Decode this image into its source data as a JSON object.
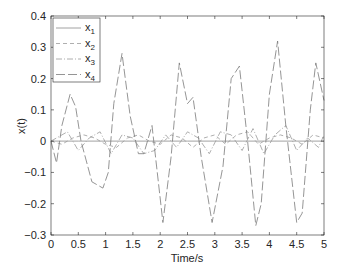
{
  "chart_data": {
    "type": "line",
    "title": "",
    "xlabel": "Time/s",
    "ylabel": "x(t)",
    "xlim": [
      0,
      5
    ],
    "ylim": [
      -0.3,
      0.4
    ],
    "grid": false,
    "legend_position": "upper-left",
    "xticks": [
      "0",
      "0.5",
      "1",
      "1.5",
      "2",
      "2.5",
      "3",
      "3.5",
      "4",
      "4.5",
      "5"
    ],
    "yticks": [
      "-0.3",
      "-0.2",
      "-0.1",
      "0",
      "0.1",
      "0.2",
      "0.3",
      "0.4"
    ],
    "series": [
      {
        "name": "x1",
        "style": "solid",
        "color": "#8a8a8a",
        "x": [
          0,
          0.5,
          1,
          1.5,
          2,
          2.5,
          3,
          3.5,
          4,
          4.5,
          5
        ],
        "values": [
          0,
          0,
          0,
          0,
          0,
          0,
          0,
          0,
          0,
          0,
          0
        ]
      },
      {
        "name": "x2",
        "style": "dashed",
        "color": "#9a9a9a",
        "x": [
          0,
          0.2,
          0.4,
          0.6,
          0.8,
          1.0,
          1.2,
          1.4,
          1.6,
          1.8,
          2.0,
          2.2,
          2.4,
          2.6,
          2.8,
          3.0,
          3.2,
          3.4,
          3.6,
          3.8,
          4.0,
          4.2,
          4.4,
          4.6,
          4.8,
          5.0
        ],
        "values": [
          0,
          -0.01,
          0.01,
          0.02,
          0.01,
          -0.01,
          -0.02,
          0.01,
          0.02,
          0.0,
          -0.01,
          0.02,
          0.01,
          -0.02,
          0.01,
          0.02,
          -0.01,
          0.02,
          0.03,
          -0.01,
          0.01,
          0.02,
          0.01,
          -0.01,
          0.02,
          0.01
        ]
      },
      {
        "name": "x3",
        "style": "dash-dot",
        "color": "#9a9a9a",
        "x": [
          0,
          0.3,
          0.5,
          0.7,
          0.9,
          1.1,
          1.3,
          1.5,
          1.7,
          1.9,
          2.1,
          2.3,
          2.5,
          2.7,
          2.9,
          3.1,
          3.3,
          3.5,
          3.7,
          3.9,
          4.1,
          4.3,
          4.5,
          4.7,
          4.9,
          5.0
        ],
        "values": [
          0,
          0.03,
          -0.03,
          0.01,
          0.03,
          -0.04,
          0.02,
          0.01,
          -0.04,
          -0.03,
          0.02,
          -0.02,
          0.03,
          0.01,
          -0.04,
          0.03,
          0.02,
          -0.03,
          0.04,
          -0.04,
          0.02,
          0.05,
          -0.03,
          0.01,
          -0.02,
          0.02
        ]
      },
      {
        "name": "x4",
        "style": "long-dash",
        "color": "#7a7a7a",
        "x": [
          0,
          0.1,
          0.2,
          0.35,
          0.45,
          0.55,
          0.75,
          0.95,
          1.05,
          1.15,
          1.3,
          1.45,
          1.6,
          1.7,
          1.85,
          2.05,
          2.2,
          2.35,
          2.5,
          2.6,
          2.75,
          2.95,
          3.15,
          3.3,
          3.45,
          3.6,
          3.75,
          3.85,
          4.0,
          4.15,
          4.3,
          4.5,
          4.6,
          4.75,
          4.85,
          5.0
        ],
        "values": [
          0,
          -0.07,
          0.05,
          0.15,
          0.11,
          0.0,
          -0.13,
          -0.15,
          -0.1,
          0.12,
          0.28,
          0.08,
          -0.04,
          -0.04,
          0.05,
          -0.26,
          -0.05,
          0.25,
          0.12,
          0.14,
          -0.05,
          -0.26,
          -0.08,
          0.2,
          0.24,
          0.0,
          -0.27,
          -0.2,
          0.15,
          0.32,
          0.05,
          -0.26,
          -0.23,
          0.1,
          0.25,
          0.13
        ]
      }
    ]
  },
  "legend": {
    "items": [
      {
        "label": "x",
        "sub": "1"
      },
      {
        "label": "x",
        "sub": "2"
      },
      {
        "label": "x",
        "sub": "3"
      },
      {
        "label": "x",
        "sub": "4"
      }
    ]
  }
}
